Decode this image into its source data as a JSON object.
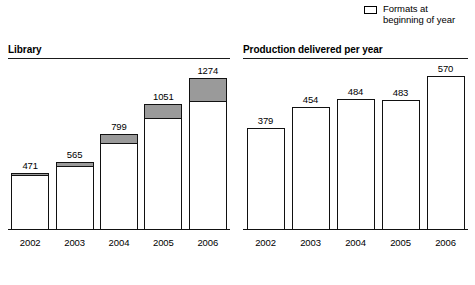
{
  "legend": {
    "position": "top-right",
    "items": [
      {
        "swatch": "filled",
        "style": "gray",
        "label": "during the year",
        "clipped": true
      },
      {
        "swatch": "empty",
        "style": "white",
        "label": "Formats at\nbeginning of year",
        "clipped": false
      }
    ]
  },
  "footer": {
    "ghost_text": ""
  },
  "colors": {
    "added_during_year": "#9a9a9a",
    "beginning_of_year": "#ffffff",
    "outline": "#111111",
    "text": "#000000"
  },
  "chart_data": [
    {
      "id": "library",
      "type": "bar",
      "stacked": true,
      "title": "Library",
      "xlabel": "",
      "ylabel": "",
      "grid": false,
      "legend_position": "top-right",
      "ylim": [
        0,
        1400
      ],
      "categories": [
        "2002",
        "2003",
        "2004",
        "2005",
        "2006"
      ],
      "totals": [
        471,
        565,
        799,
        1051,
        1274
      ],
      "series": [
        {
          "name": "Formats at beginning of year",
          "values": [
            461,
            522,
            715,
            930,
            1070
          ]
        },
        {
          "name": "Formats added during the year",
          "values": [
            10,
            43,
            84,
            121,
            204
          ]
        }
      ],
      "data_labels": [
        "471",
        "565",
        "799",
        "1051",
        "1274"
      ]
    },
    {
      "id": "production",
      "type": "bar",
      "stacked": false,
      "title": "Production delivered per year",
      "xlabel": "",
      "ylabel": "",
      "grid": false,
      "ylim": [
        0,
        620
      ],
      "categories": [
        "2002",
        "2003",
        "2004",
        "2005",
        "2006"
      ],
      "values": [
        379,
        454,
        484,
        483,
        570
      ],
      "data_labels": [
        "379",
        "454",
        "484",
        "483",
        "570"
      ]
    }
  ]
}
